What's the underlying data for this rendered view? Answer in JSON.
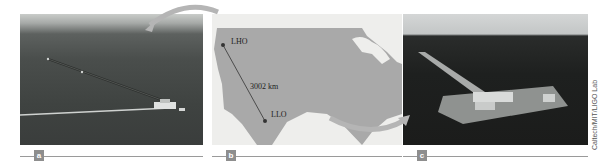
{
  "figure": {
    "panels": [
      {
        "label": "a",
        "description": "Aerial photo of LIGO Hanford Observatory (LHO)"
      },
      {
        "label": "b",
        "description": "Map of the United States showing detector locations"
      },
      {
        "label": "c",
        "description": "Aerial photo of LIGO Livingston Observatory (LLO)"
      }
    ],
    "map": {
      "site1": "LHO",
      "site2": "LLO",
      "distance": "3002 km"
    },
    "credit": "Caltech/MIT/LIGO Lab",
    "colors": {
      "land": "#a9a9a9",
      "water": "#eeeeec",
      "arrow": "#b5b5b5",
      "label_tag": "#8e8e8e"
    }
  }
}
